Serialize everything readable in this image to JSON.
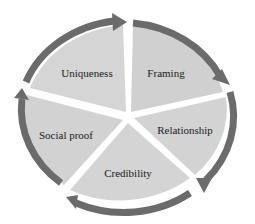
{
  "diagram": {
    "type": "cycle",
    "center": {
      "x": 128,
      "y": 118
    },
    "colors": {
      "segment_fill": "#d3d3d3",
      "segment_fill_light": "#dcdcdc",
      "arrow": "#6b6b6b",
      "gap": "#ffffff",
      "text": "#1a1a1a"
    },
    "segments": [
      {
        "label": "Uniqueness",
        "label_x": 87,
        "label_y": 73
      },
      {
        "label": "Framing",
        "label_x": 166,
        "label_y": 73
      },
      {
        "label": "Relationship",
        "label_x": 185,
        "label_y": 130
      },
      {
        "label": "Credibility",
        "label_x": 128,
        "label_y": 173
      },
      {
        "label": "Social proof",
        "label_x": 66,
        "label_y": 135
      }
    ],
    "flow_direction": "clockwise"
  }
}
